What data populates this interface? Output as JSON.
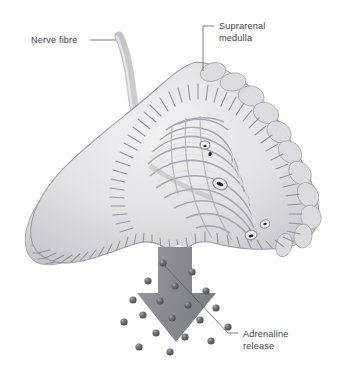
{
  "figure": {
    "background_color": "#ffffff"
  },
  "labels": [
    {
      "id": "nerve-fibre",
      "text": "Nerve fibre",
      "lines": [
        "Nerve fibre"
      ],
      "x": 31,
      "y": 43,
      "anchor": "start",
      "leader": "M 90 40 L 116 40"
    },
    {
      "id": "suprarenal-medulla",
      "text": "Suprarenal medulla",
      "lines": [
        "Suprarenal",
        "medulla"
      ],
      "x": 219,
      "y": 29,
      "anchor": "start",
      "leader": "M 214 26 L 203 26 L 203 71"
    },
    {
      "id": "adrenaline-release",
      "text": "Adrenaline release",
      "lines": [
        "Adrenaline",
        "release"
      ],
      "x": 243,
      "y": 337,
      "anchor": "start",
      "leader": "M 238 333 L 228 333 L 163 264"
    }
  ],
  "colors": {
    "tissue_base": "#e6e6e8",
    "tissue_mid": "#cfcfd3",
    "tissue_shadow": "#a9a9b0",
    "striation": "#8e8e96",
    "capsule_outline": "#9b9ba2",
    "arrow_fill": "#8c8c92",
    "granule_fill": "#5f5f68",
    "granule_highlight": "#9d9da6",
    "label_text": "#3e4046",
    "leader_line": "#5a5c62",
    "vessel_lumen": "#1e1e22"
  },
  "anatomy": {
    "gland_name": "suprarenal gland",
    "parts": [
      "cortex with radiating striations",
      "medulla with convoluted cords",
      "lobulated outer capsule",
      "left lobe (wing)",
      "right lobe (wing)",
      "vessel cross-sections"
    ],
    "nerve": {
      "name": "nerve fibre",
      "description": "curved tubular nerve descending from upper left into the gland"
    }
  },
  "arrow": {
    "name": "adrenaline-release-arrow",
    "direction": "down",
    "fill": "#8c8c92",
    "shaft": {
      "x": 158,
      "y": 247,
      "width": 34,
      "height": 52
    },
    "head": {
      "left": 137,
      "right": 216,
      "top": 293,
      "tip_x": 176,
      "tip_y": 342
    }
  },
  "granules": {
    "name": "adrenaline-granules",
    "count": 19,
    "radius": 3.6,
    "points": [
      {
        "x": 163,
        "y": 263
      },
      {
        "x": 192,
        "y": 272
      },
      {
        "x": 148,
        "y": 281
      },
      {
        "x": 175,
        "y": 286
      },
      {
        "x": 206,
        "y": 291
      },
      {
        "x": 133,
        "y": 300
      },
      {
        "x": 160,
        "y": 301
      },
      {
        "x": 188,
        "y": 305
      },
      {
        "x": 216,
        "y": 308
      },
      {
        "x": 143,
        "y": 315
      },
      {
        "x": 172,
        "y": 318
      },
      {
        "x": 200,
        "y": 320
      },
      {
        "x": 124,
        "y": 322
      },
      {
        "x": 228,
        "y": 327
      },
      {
        "x": 156,
        "y": 333
      },
      {
        "x": 185,
        "y": 337
      },
      {
        "x": 211,
        "y": 341
      },
      {
        "x": 139,
        "y": 347
      },
      {
        "x": 170,
        "y": 352
      }
    ]
  }
}
